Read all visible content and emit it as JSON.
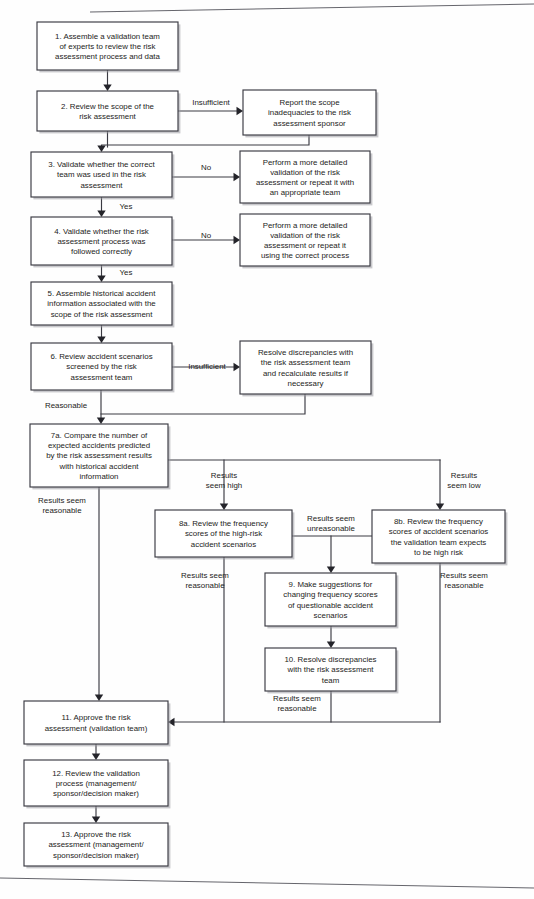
{
  "document": {
    "title": "Risk Assessment Validation Process Flowchart",
    "page_background": "#fefefe",
    "line_color": "#3a3a42",
    "text_color": "#1d1d22"
  },
  "nodes": [
    {
      "id": "n1",
      "name": "step-1-assemble-validation-team",
      "x": 37,
      "y": 22,
      "w": 141,
      "h": 48,
      "lines": [
        "1.  Assemble a validation team",
        "of experts to review the risk",
        "assessment process and data"
      ]
    },
    {
      "id": "n2",
      "name": "step-2-review-scope",
      "x": 37,
      "y": 91,
      "w": 141,
      "h": 40,
      "lines": [
        "2.  Review the scope of the",
        "risk assessment"
      ]
    },
    {
      "id": "r2",
      "name": "report-scope-inadequacies",
      "x": 243,
      "y": 90,
      "w": 133,
      "h": 45,
      "lines": [
        "Report the scope",
        "inadequacies to the risk",
        "assessment sponsor"
      ]
    },
    {
      "id": "n3",
      "name": "step-3-validate-correct-team",
      "x": 31,
      "y": 152,
      "w": 141,
      "h": 45,
      "lines": [
        "3.  Validate whether the correct",
        "team was used in the risk",
        "assessment"
      ]
    },
    {
      "id": "r3",
      "name": "perform-detailed-validation-team",
      "x": 240,
      "y": 151,
      "w": 130,
      "h": 52,
      "lines": [
        "Perform a more detailed",
        "validation of the risk",
        "assessment or repeat it with",
        "an appropriate team"
      ]
    },
    {
      "id": "n4",
      "name": "step-4-validate-process-followed",
      "x": 31,
      "y": 217,
      "w": 141,
      "h": 48,
      "lines": [
        "4.  Validate whether the risk",
        "assessment process was",
        "followed correctly"
      ]
    },
    {
      "id": "r4",
      "name": "perform-detailed-validation-process",
      "x": 240,
      "y": 214,
      "w": 130,
      "h": 52,
      "lines": [
        "Perform a more detailed",
        "validation of the risk",
        "assessment or repeat it",
        "using the correct process"
      ]
    },
    {
      "id": "n5",
      "name": "step-5-assemble-historical-accident-info",
      "x": 31,
      "y": 282,
      "w": 141,
      "h": 43,
      "lines": [
        "5.  Assemble historical accident",
        "information associated with the",
        "scope of the risk assessment"
      ]
    },
    {
      "id": "n6",
      "name": "step-6-review-accident-scenarios",
      "x": 31,
      "y": 343,
      "w": 141,
      "h": 47,
      "lines": [
        "6.  Review accident scenarios",
        "screened by the risk",
        "assessment team"
      ]
    },
    {
      "id": "r6",
      "name": "resolve-discrepancies-recalculate",
      "x": 240,
      "y": 341,
      "w": 131,
      "h": 53,
      "lines": [
        "Resolve discrepancies with",
        "the risk assessment team",
        "and recalculate results if",
        "necessary"
      ]
    },
    {
      "id": "n7",
      "name": "step-7a-compare-expected-accidents",
      "x": 30,
      "y": 424,
      "w": 138,
      "h": 63,
      "lines": [
        "7a.  Compare the number of",
        "expected accidents predicted",
        "by the risk assessment results",
        "with historical accident",
        "information"
      ]
    },
    {
      "id": "n8a",
      "name": "step-8a-review-frequency-high-risk",
      "x": 155,
      "y": 510,
      "w": 137,
      "h": 47,
      "lines": [
        "8a.  Review the frequency",
        "scores of the high-risk",
        "accident scenarios"
      ]
    },
    {
      "id": "n8b",
      "name": "step-8b-review-frequency-expected-high-risk",
      "x": 372,
      "y": 510,
      "w": 133,
      "h": 53,
      "lines": [
        "8b.  Review the frequency",
        "scores of accident scenarios",
        "the validation team expects",
        "to be high risk"
      ]
    },
    {
      "id": "n9",
      "name": "step-9-make-suggestions-frequency-scores",
      "x": 265,
      "y": 573,
      "w": 131,
      "h": 53,
      "lines": [
        "9.  Make suggestions for",
        "changing frequency scores",
        "of questionable accident",
        "scenarios"
      ]
    },
    {
      "id": "n10",
      "name": "step-10-resolve-discrepancies-team",
      "x": 265,
      "y": 648,
      "w": 131,
      "h": 43,
      "lines": [
        "10.  Resolve discrepancies",
        "with the risk assessment",
        "team"
      ]
    },
    {
      "id": "n11",
      "name": "step-11-approve-risk-assessment-validation-team",
      "x": 24,
      "y": 701,
      "w": 144,
      "h": 43,
      "lines": [
        "11.  Approve the risk",
        "assessment (validation team)"
      ]
    },
    {
      "id": "n12",
      "name": "step-12-review-validation-process",
      "x": 24,
      "y": 760,
      "w": 144,
      "h": 46,
      "lines": [
        "12.  Review the validation",
        "process (management/",
        "sponsor/decision maker)"
      ]
    },
    {
      "id": "n13",
      "name": "step-13-approve-risk-assessment-management",
      "x": 24,
      "y": 823,
      "w": 144,
      "h": 43,
      "lines": [
        "13.  Approve the risk",
        "assessment (management/",
        "sponsor/decision maker)"
      ]
    }
  ],
  "edge_labels": [
    {
      "name": "label-insufficient-step2",
      "x": 211,
      "y": 105,
      "lines": [
        "Insufficient"
      ]
    },
    {
      "name": "label-no-step3",
      "x": 206,
      "y": 170,
      "lines": [
        "No"
      ]
    },
    {
      "name": "label-yes-step3",
      "x": 126,
      "y": 209,
      "lines": [
        "Yes"
      ]
    },
    {
      "name": "label-no-step4",
      "x": 206,
      "y": 238,
      "lines": [
        "No"
      ]
    },
    {
      "name": "label-yes-step4",
      "x": 126,
      "y": 275,
      "lines": [
        "Yes"
      ]
    },
    {
      "name": "label-insufficient-step6",
      "x": 207,
      "y": 369,
      "lines": [
        "Insufficient"
      ]
    },
    {
      "name": "label-reasonable-step6",
      "x": 66,
      "y": 408,
      "lines": [
        "Reasonable"
      ]
    },
    {
      "name": "label-results-seem-high",
      "x": 224,
      "y": 478,
      "lines": [
        "Results",
        "seem high"
      ]
    },
    {
      "name": "label-results-seem-low",
      "x": 464,
      "y": 478,
      "lines": [
        "Results",
        "seem low"
      ]
    },
    {
      "name": "label-results-seem-reasonable-7a",
      "x": 62,
      "y": 503,
      "lines": [
        "Results seem",
        "reasonable"
      ]
    },
    {
      "name": "label-results-seem-unreasonable",
      "x": 331,
      "y": 521,
      "lines": [
        "Results seem",
        "unreasonable"
      ]
    },
    {
      "name": "label-results-seem-reasonable-8a",
      "x": 205,
      "y": 578,
      "lines": [
        "Results seem",
        "reasonable"
      ]
    },
    {
      "name": "label-results-seem-reasonable-8b",
      "x": 464,
      "y": 578,
      "lines": [
        "Results seem",
        "reasonable"
      ]
    },
    {
      "name": "label-results-seem-reasonable-10",
      "x": 297,
      "y": 701,
      "lines": [
        "Results seem",
        "reasonable"
      ]
    }
  ],
  "connectors": [
    {
      "name": "edge-1-to-2",
      "path": "M107.5,70 L107.5,86",
      "arrow": "down",
      "ax": 107.5,
      "ay": 91
    },
    {
      "name": "edge-2-to-report",
      "path": "M178,111 L238,111",
      "arrow": "right",
      "ax": 243,
      "ay": 111
    },
    {
      "name": "edge-report-back-to-3",
      "path": "M309,135 L309,145 L101.5,145 L101.5,147",
      "arrow": "down",
      "ax": 101.5,
      "ay": 152
    },
    {
      "name": "edge-2-to-3",
      "path": "M107.5,131 L107.5,147",
      "arrow": "none",
      "ax": 0,
      "ay": 0
    },
    {
      "name": "edge-3-to-perform",
      "path": "M172,177 L235,177",
      "arrow": "right",
      "ax": 240,
      "ay": 177
    },
    {
      "name": "edge-3-to-4",
      "path": "M101.5,197 L101.5,212",
      "arrow": "down",
      "ax": 101.5,
      "ay": 217
    },
    {
      "name": "edge-4-to-perform",
      "path": "M172,240 L235,240",
      "arrow": "right",
      "ax": 240,
      "ay": 240
    },
    {
      "name": "edge-4-to-5",
      "path": "M101.5,265 L101.5,277",
      "arrow": "down",
      "ax": 101.5,
      "ay": 282
    },
    {
      "name": "edge-5-to-6",
      "path": "M101.5,325 L101.5,338",
      "arrow": "down",
      "ax": 101.5,
      "ay": 343
    },
    {
      "name": "edge-6-to-resolve",
      "path": "M172,367 L235,367",
      "arrow": "right",
      "ax": 240,
      "ay": 367
    },
    {
      "name": "edge-resolve-back-to-7a",
      "path": "M305,394 L305,414 L101,414",
      "arrow": "none",
      "ax": 0,
      "ay": 0
    },
    {
      "name": "edge-6-to-7a",
      "path": "M101,390 L101,419",
      "arrow": "down",
      "ax": 101,
      "ay": 424
    },
    {
      "name": "edge-7a-branch-bus",
      "path": "M168,460 L440,460",
      "arrow": "none",
      "ax": 0,
      "ay": 0
    },
    {
      "name": "edge-branch-high-to-8a",
      "path": "M224,460 L224,505",
      "arrow": "down",
      "ax": 224,
      "ay": 510
    },
    {
      "name": "edge-branch-low-to-8b",
      "path": "M440,460 L440,505",
      "arrow": "down",
      "ax": 440,
      "ay": 510
    },
    {
      "name": "edge-7a-reasonable-to-11",
      "path": "M99,487 L99,696",
      "arrow": "down",
      "ax": 99,
      "ay": 701
    },
    {
      "name": "edge-8a-to-9-bus",
      "path": "M292,536 L372,536",
      "arrow": "none",
      "ax": 0,
      "ay": 0
    },
    {
      "name": "edge-unreasonable-to-9",
      "path": "M331,536 L331,568",
      "arrow": "down",
      "ax": 331,
      "ay": 573
    },
    {
      "name": "edge-9-to-10",
      "path": "M331,626 L331,643",
      "arrow": "down",
      "ax": 331,
      "ay": 648
    },
    {
      "name": "edge-8a-reasonable-to-11",
      "path": "M224,557 L224,722",
      "arrow": "none",
      "ax": 0,
      "ay": 0
    },
    {
      "name": "edge-10-reasonable-to-11",
      "path": "M331,691 L331,722",
      "arrow": "none",
      "ax": 0,
      "ay": 0
    },
    {
      "name": "edge-8b-reasonable-to-11",
      "path": "M440,563 L440,722",
      "arrow": "none",
      "ax": 0,
      "ay": 0
    },
    {
      "name": "edge-feedback-bus-to-11",
      "path": "M440,722 L173,722",
      "arrow": "left",
      "ax": 168,
      "ay": 722
    },
    {
      "name": "edge-11-to-12",
      "path": "M96,744 L96,755",
      "arrow": "down",
      "ax": 96,
      "ay": 760
    },
    {
      "name": "edge-12-to-13",
      "path": "M96,806 L96,818",
      "arrow": "down",
      "ax": 96,
      "ay": 823
    }
  ],
  "scan_edges": [
    {
      "name": "scan-line-top",
      "path": "M90,12 L534,4"
    },
    {
      "name": "scan-line-bottom",
      "path": "M0,878 L534,888"
    }
  ]
}
